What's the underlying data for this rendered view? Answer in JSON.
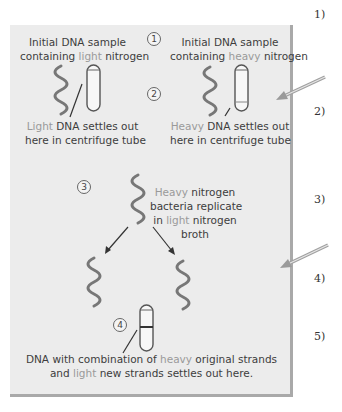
{
  "question_numbers": [
    "1)",
    "2)",
    "3)",
    "4)",
    "5)"
  ],
  "steps": [
    "1",
    "2",
    "3",
    "4"
  ],
  "panel1_left": {
    "line1": "Initial DNA sample",
    "line2_a": "containing ",
    "line2_b": "light",
    "line2_c": " nitrogen",
    "caption1_a": "Light",
    "caption1_b": " DNA settles out",
    "caption2": "here in centrifuge tube"
  },
  "panel1_right": {
    "line1": "Initial DNA sample",
    "line2_a": "containing ",
    "line2_b": "heavy",
    "line2_c": " nitrogen",
    "caption1_a": "Heavy",
    "caption1_b": " DNA settles out",
    "caption2": "here in centrifuge tube"
  },
  "step3": {
    "line1_a": "Heavy",
    "line1_b": " nitrogen",
    "line2": "bacteria replicate",
    "line3_a": "in ",
    "line3_b": "light",
    "line3_c": " nitrogen",
    "line4": "broth"
  },
  "step4": {
    "line1_a": "DNA with combination of ",
    "line1_b": "heavy",
    "line1_c": " original strands",
    "line2_a": "and ",
    "line2_b": "light",
    "line2_c": " new strands settles out here."
  },
  "colors": {
    "panel_bg": "#ececec",
    "text_dark": "#3d3d3d",
    "text_light": "#9a9a9a",
    "pointer_arrow": "#a0a0a0"
  }
}
